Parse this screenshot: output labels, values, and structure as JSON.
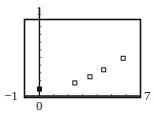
{
  "chart_data": {
    "type": "scatter",
    "title": "",
    "xlabel": "",
    "ylabel": "",
    "xlim": [
      -1,
      7
    ],
    "ylim": [
      0,
      1
    ],
    "x_ticks_step": 1,
    "y_ticks_step": 0.1,
    "grid": false,
    "legend": null,
    "labels": {
      "xmin": "−1",
      "xmax": "7",
      "ymax": "1",
      "origin": "0"
    },
    "series": [
      {
        "name": "data",
        "marker": "square",
        "points": [
          {
            "x": 0,
            "y": 0.09,
            "filled": true
          },
          {
            "x": 2.45,
            "y": 0.17,
            "filled": false
          },
          {
            "x": 3.5,
            "y": 0.25,
            "filled": false
          },
          {
            "x": 4.45,
            "y": 0.34,
            "filled": false
          },
          {
            "x": 5.8,
            "y": 0.49,
            "filled": false
          }
        ]
      }
    ]
  }
}
